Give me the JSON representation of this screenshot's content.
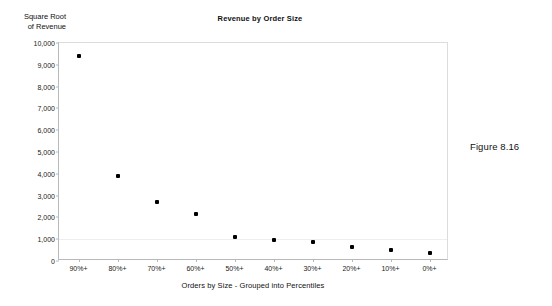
{
  "figure": {
    "caption": "Figure 8.16"
  },
  "chart_data": {
    "type": "scatter",
    "title": "Revenue by Order Size",
    "xlabel": "Orders by Size - Grouped into Percentiles",
    "ylabel": "Square Root\nof Revenue",
    "ylabel_lines": [
      "Square Root",
      "of Revenue"
    ],
    "categories": [
      "90%+",
      "80%+",
      "70%+",
      "60%+",
      "50%+",
      "40%+",
      "30%+",
      "20%+",
      "10%+",
      "0%+"
    ],
    "values": [
      9400,
      3900,
      2700,
      2150,
      1100,
      950,
      850,
      650,
      520,
      350
    ],
    "ylim": [
      0,
      10000
    ],
    "ytick_step": 1000,
    "yticks": [
      0,
      1000,
      2000,
      3000,
      4000,
      5000,
      6000,
      7000,
      8000,
      9000,
      10000
    ],
    "ytick_labels": [
      "0",
      "1,000",
      "2,000",
      "3,000",
      "4,000",
      "5,000",
      "6,000",
      "7,000",
      "8,000",
      "9,000",
      "10,000"
    ],
    "grid": "faint-horizontal",
    "legend": "none",
    "marker_color": "#000000",
    "marker_shape": "square",
    "axis_color": "#b9b9b9",
    "series": [
      {
        "name": "Square Root of Revenue",
        "values": [
          9400,
          3900,
          2700,
          2150,
          1100,
          950,
          850,
          650,
          520,
          350
        ]
      }
    ]
  }
}
